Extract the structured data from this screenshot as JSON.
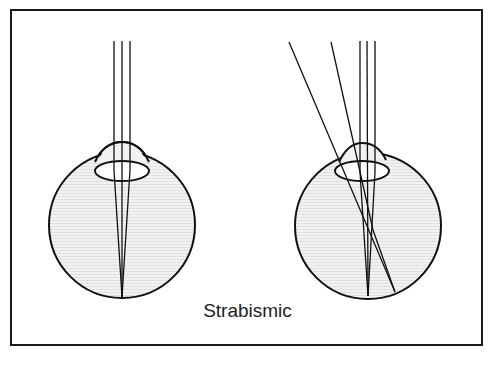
{
  "diagram": {
    "caption": "Strabismic",
    "colors": {
      "stroke": "#111111",
      "eye_fill": "#ececec",
      "frame": "#1a1a1a",
      "background": "#ffffff"
    },
    "eyes": [
      {
        "name": "left-eye",
        "rays": "three parallel rays converging to a single point on retina"
      },
      {
        "name": "right-eye",
        "rays": "three parallel rays plus two oblique rays focusing at different retinal points"
      }
    ]
  }
}
